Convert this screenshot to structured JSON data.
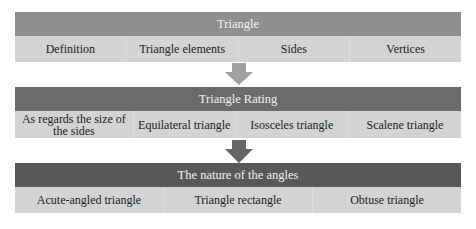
{
  "colors": {
    "header1": "#8f8f8f",
    "header2": "#6b6b6b",
    "header3": "#585858",
    "row_bg": "#d3d3d3",
    "arrow1": "#a0a0a0",
    "arrow2": "#6e6e6e",
    "arrow3": "#5e5e5e"
  },
  "sections": [
    {
      "title": "Triangle",
      "items": [
        "Definition",
        "Triangle elements",
        "Sides",
        "Vertices"
      ]
    },
    {
      "title": "Triangle Rating",
      "items": [
        "As regards the size of the sides",
        "Equilateral triangle",
        "Isosceles triangle",
        "Scalene triangle"
      ]
    },
    {
      "title": "The nature of the angles",
      "items": [
        "Acute-angled triangle",
        "Triangle rectangle",
        "Obtuse triangle"
      ]
    }
  ]
}
